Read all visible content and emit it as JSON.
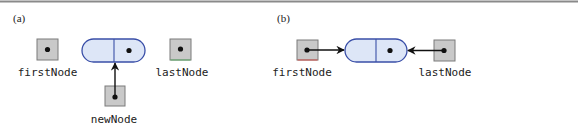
{
  "colors": {
    "top_rule": "#8a8a8a",
    "ref_box_fill": "#c9c9c9",
    "ref_box_stroke": "#7a7a7a",
    "node_fill": "#dde6f7",
    "node_stroke": "#3a4fa8",
    "pointer": "#111111",
    "first_node_accent": "#d0504a",
    "last_node_accent": "#5fae6a"
  },
  "panels": [
    {
      "id": "a",
      "label": "(a)",
      "refs": {
        "first": "firstNode",
        "last": "lastNode",
        "new": "newNode"
      },
      "description": "newNode references a new node; firstNode and lastNode are null"
    },
    {
      "id": "b",
      "label": "(b)",
      "refs": {
        "first": "firstNode",
        "last": "lastNode"
      },
      "description": "firstNode and lastNode both reference the single node"
    }
  ]
}
